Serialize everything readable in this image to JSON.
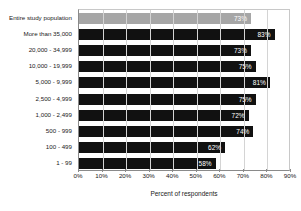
{
  "chart_data": {
    "type": "bar",
    "orientation": "horizontal",
    "title": "",
    "xlabel": "Percent of respondents",
    "ylabel": "",
    "xlim": [
      0,
      90
    ],
    "xticks": [
      "0%",
      "10%",
      "20%",
      "30%",
      "40%",
      "50%",
      "60%",
      "70%",
      "80%",
      "90%"
    ],
    "grid": true,
    "legend": "none",
    "categories": [
      "Entire study population",
      "More than 35,000",
      "20,000 - 34,999",
      "10,000 - 19,999",
      "5,000 - 9,999",
      "2,500 - 4,999",
      "1,000 - 2,499",
      "500 - 999",
      "100 - 499",
      "1 - 99"
    ],
    "values": [
      73,
      83,
      73,
      75,
      81,
      75,
      72,
      74,
      62,
      58
    ],
    "data_labels": [
      "73%",
      "83%",
      "73%",
      "75%",
      "81%",
      "75%",
      "72%",
      "74%",
      "62%",
      "58%"
    ],
    "colors": {
      "default_bar": "#111111",
      "highlight_bar": "#a6a6a6",
      "data_label_text": "#ffffff",
      "axis": "#8a8a8a",
      "grid": "#d4d4d4",
      "background": "#ffffff"
    },
    "highlight_index": 0
  }
}
